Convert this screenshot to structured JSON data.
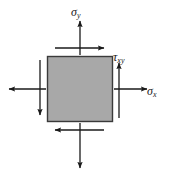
{
  "figure": {
    "name": "plane-stress-element",
    "width": 170,
    "height": 175,
    "background_color": "#ffffff"
  },
  "element": {
    "shape": "square",
    "fill_color": "#a8a8a8",
    "stroke_color": "#3a3a3a",
    "x": 47,
    "y": 56,
    "width": 66,
    "height": 66
  },
  "labels": {
    "sigma_y": {
      "symbol": "σ",
      "subscript": "y"
    },
    "tau_xy": {
      "symbol": "τ",
      "subscript": "xy"
    },
    "sigma_x": {
      "symbol": "σ",
      "subscript": "x"
    }
  },
  "arrows": {
    "stroke_color": "#1a1a1a",
    "items": [
      {
        "name": "sigma-y-top",
        "direction": "up",
        "label": "sigma_y",
        "x1": 80,
        "y1": 55,
        "x2": 80,
        "y2": 21
      },
      {
        "name": "sigma-y-bottom",
        "direction": "down",
        "label": "sigma_y",
        "x1": 80,
        "y1": 123,
        "x2": 80,
        "y2": 168
      },
      {
        "name": "sigma-x-right",
        "direction": "right",
        "label": "sigma_x",
        "x1": 114,
        "y1": 89,
        "x2": 147,
        "y2": 89
      },
      {
        "name": "sigma-x-left",
        "direction": "left",
        "label": "sigma_x",
        "x1": 46,
        "y1": 89,
        "x2": 9,
        "y2": 89
      },
      {
        "name": "tau-top-shear",
        "direction": "right",
        "label": "tau_xy",
        "x1": 55,
        "y1": 48,
        "x2": 104,
        "y2": 48
      },
      {
        "name": "tau-bottom-shear",
        "direction": "left",
        "label": "tau_xy",
        "x1": 104,
        "y1": 130,
        "x2": 55,
        "y2": 130
      },
      {
        "name": "tau-right-shear",
        "direction": "up",
        "label": "tau_xy",
        "x1": 119,
        "y1": 118,
        "x2": 119,
        "y2": 63
      },
      {
        "name": "tau-left-shear",
        "direction": "down",
        "label": "tau_xy",
        "x1": 40,
        "y1": 60,
        "x2": 40,
        "y2": 115
      }
    ]
  }
}
